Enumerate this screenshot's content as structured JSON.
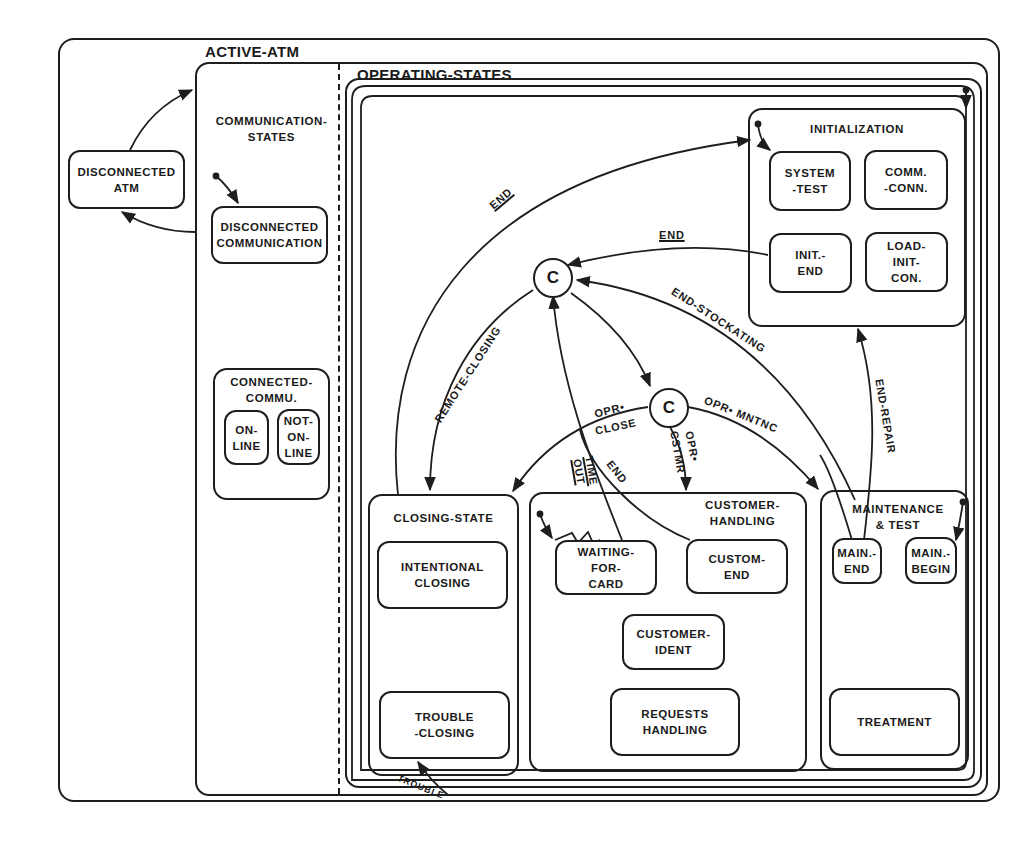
{
  "diagram": {
    "type": "statechart",
    "root_external_state": "DISCONNECTED\nATM",
    "active_atm": {
      "label": "ACTIVE-ATM",
      "communication_states": {
        "label": "COMMUNICATION-\nSTATES",
        "disconnected": "DISCONNECTED\nCOMMUNICATION",
        "connected": {
          "label": "CONNECTED-\nCOMMU.",
          "on_line": "ON-\nLINE",
          "not_on_line": "NOT-\nON-\nLINE"
        }
      },
      "operating_states": {
        "label": "OPERATING-STATES",
        "initialization": {
          "label": "INITIALIZATION",
          "system_test": "SYSTEM\n-TEST",
          "comm_conn": "COMM.\n-CONN.",
          "init_end": "INIT.-\nEND",
          "load_init_con": "LOAD-\nINIT-\nCON."
        },
        "closing_state": {
          "label": "CLOSING-STATE",
          "intentional_closing": "INTENTIONAL\nCLOSING",
          "trouble_closing": "TROUBLE\n-CLOSING"
        },
        "customer_handling": {
          "label": "CUSTOMER-\nHANDLING",
          "waiting_for_card": "WAITING-\nFOR-\nCARD",
          "custom_end": "CUSTOM-\nEND",
          "customer_ident": "CUSTOMER-\nIDENT",
          "requests_handling": "REQUESTS\nHANDLING"
        },
        "maintenance_test": {
          "label": "MAINTENANCE\n& TEST",
          "main_end": "MAIN.-\nEND",
          "main_begin": "MAIN.-\nBEGIN",
          "treatment": "TREATMENT"
        },
        "conditions": {
          "c1": "C",
          "c2": "C"
        }
      }
    },
    "transitions": {
      "end_outer": "END",
      "end_init": "END",
      "end_stockating": "END-STOCKATING",
      "remote_closing": "REMOTE-CLOSING",
      "opr_close_1": "OPR•",
      "opr_close_2": "CLOSE",
      "opr_mntnc": "OPR• MNTNC",
      "opr_cstmr_1": "OPR•",
      "opr_cstmr_2": "CSTMR",
      "time_out_1": "TIME",
      "time_out_2": "OUT",
      "end_customer": "END",
      "end_repair": "END-REPAIR",
      "trouble": "TROUBLE"
    }
  }
}
